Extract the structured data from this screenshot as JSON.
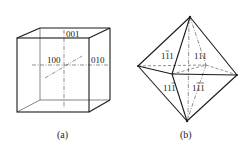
{
  "figure_a": {
    "caption": "(a)",
    "shape": "cube",
    "labels": {
      "top": "001",
      "front": "100",
      "right": "010"
    }
  },
  "figure_b": {
    "caption": "(b)",
    "shape": "octahedron",
    "labels": {
      "upper_left": {
        "d1": "1",
        "d2": "1",
        "d3": "1",
        "bars": [
          false,
          true,
          false
        ]
      },
      "upper_right": {
        "d1": "1",
        "d2": "1",
        "d3": "1",
        "bars": [
          false,
          false,
          false
        ]
      },
      "lower_left": {
        "d1": "1",
        "d2": "1",
        "d3": "1",
        "bars": [
          false,
          false,
          true
        ]
      },
      "lower_right": {
        "d1": "1",
        "d2": "1",
        "d3": "1",
        "bars": [
          false,
          true,
          true
        ]
      }
    }
  },
  "colors": {
    "line": "#1a1a1a",
    "background": "#ffffff"
  }
}
